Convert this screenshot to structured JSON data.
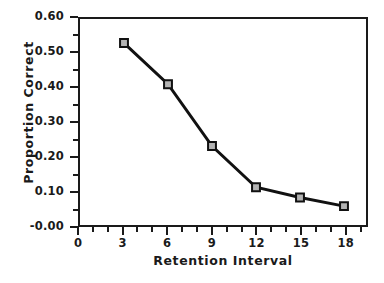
{
  "chart_data": {
    "type": "line",
    "title": "",
    "xlabel": "Retention Interval",
    "ylabel": "Proportion Correct",
    "x": [
      3,
      6,
      9,
      12,
      15,
      18
    ],
    "values": [
      0.53,
      0.41,
      0.23,
      0.11,
      0.08,
      0.055
    ],
    "series": [
      {
        "name": "Proportion Correct",
        "x": [
          3,
          6,
          9,
          12,
          15,
          18
        ],
        "values": [
          0.53,
          0.41,
          0.23,
          0.11,
          0.08,
          0.055
        ]
      }
    ],
    "xlim": [
      0,
      19.5
    ],
    "ylim": [
      0,
      0.6
    ],
    "xticks": [
      0,
      3,
      6,
      9,
      12,
      15,
      18
    ],
    "yticks": [
      0.0,
      0.1,
      0.2,
      0.3,
      0.4,
      0.5,
      0.6
    ],
    "xtick_labels": [
      "0",
      "3",
      "6",
      "9",
      "12",
      "15",
      "18"
    ],
    "ytick_labels": [
      "-0.00",
      "0.10",
      "0.20",
      "0.30",
      "0.40",
      "0.50",
      "0.60"
    ],
    "x_minor_tick_interval": 1,
    "y_minor_tick_interval": 0.05,
    "grid": false,
    "legend": "none",
    "marker": "square",
    "line_color": "#111111",
    "marker_fill_color": "#b3b3b3",
    "marker_edge_color": "#111111",
    "frame_color": "#1a1a1a",
    "background_color": "#ffffff"
  },
  "axes": {
    "y_labels": [
      "0.60",
      "0.50",
      "0.40",
      "0.30",
      "0.20",
      "0.10",
      "-0.00"
    ],
    "x_labels": [
      "0",
      "3",
      "6",
      "9",
      "12",
      "15",
      "18"
    ],
    "y_title": "Proportion Correct",
    "x_title": "Retention Interval"
  }
}
